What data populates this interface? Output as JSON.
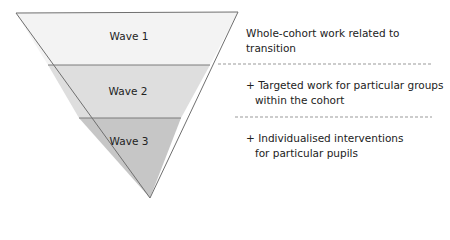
{
  "diagram": {
    "type": "inverted-pyramid",
    "colors": {
      "wave1_fill": "#f3f3f3",
      "wave2_fill": "#dedede",
      "wave3_fill": "#c6c6c6",
      "outline": "#6f6f6f",
      "dashed_line": "#999999"
    },
    "tiers": [
      {
        "label": "Wave 1",
        "description_lines": [
          "Whole-cohort work related to transition"
        ]
      },
      {
        "label": "Wave 2",
        "description_lines": [
          "+ Targeted work for particular groups",
          "within the cohort"
        ]
      },
      {
        "label": "Wave 3",
        "description_lines": [
          "+ Individualised interventions",
          "for particular pupils"
        ]
      }
    ]
  }
}
